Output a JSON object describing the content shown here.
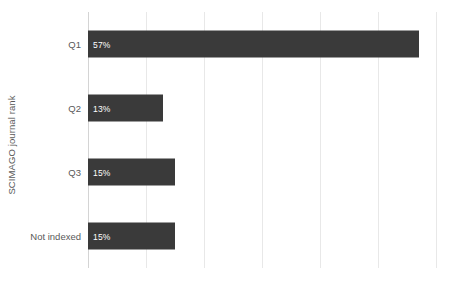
{
  "chart_data": {
    "type": "bar",
    "orientation": "horizontal",
    "title": "",
    "xlabel": "",
    "ylabel": "SCIMAGO journal rank",
    "categories": [
      "Q1",
      "Q2",
      "Q3",
      "Not indexed"
    ],
    "values": [
      57,
      13,
      15,
      15
    ],
    "data_labels": [
      "57%",
      "13%",
      "15%",
      "15%"
    ],
    "series": [
      {
        "name": "",
        "values": [
          57,
          13,
          15,
          15
        ]
      }
    ],
    "xlim": [
      0,
      60
    ],
    "xticks": [
      0,
      10,
      20,
      30,
      40,
      50,
      60
    ],
    "xtick_labels": [
      "",
      "",
      "",
      "",
      "",
      "",
      ""
    ],
    "grid": "vertical",
    "legend": "none",
    "bar_color": "#3a3a3a",
    "gridline_color": "#e8e8e8",
    "axis_color": "#d4d4d4",
    "label_color": "#595959",
    "data_label_color": "#ffffff",
    "background": "#ffffff"
  },
  "axis": {
    "y_title": "SCIMAGO journal rank"
  }
}
